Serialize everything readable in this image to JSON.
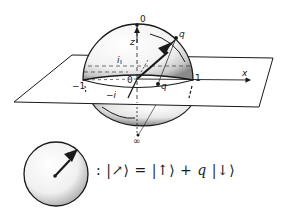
{
  "figure": {
    "type": "Riemann sphere stereographic projection of spin state",
    "labels": {
      "north_pole": "0",
      "south_pole": "∞",
      "z_axis": "z",
      "x_axis": "x",
      "origin": "0",
      "plus_one": "1",
      "minus_one": "−1",
      "plus_i": "i",
      "minus_i": "−i",
      "sphere_point": "q",
      "plane_point": "q"
    },
    "equation": {
      "colon": ":",
      "lhs": "|↗⟩",
      "equals": "=",
      "term1": "|↑⟩",
      "plus": "+",
      "coef": "q",
      "term2": "|↓⟩"
    },
    "colors": {
      "ink": "#1a1a1a",
      "paper": "#ffffff",
      "stipple": "#555555"
    }
  }
}
